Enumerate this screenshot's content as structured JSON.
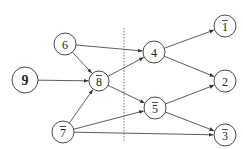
{
  "diagram": {
    "type": "directed-graph",
    "divider": {
      "x": 124,
      "y1": 28,
      "y2": 141,
      "style": "dashed"
    },
    "nodes": [
      {
        "id": "6",
        "label": "6",
        "overline": false,
        "bold": false,
        "x": 65,
        "y": 44,
        "r": 11
      },
      {
        "id": "9",
        "label": "9",
        "overline": false,
        "bold": true,
        "x": 25,
        "y": 80,
        "r": 13
      },
      {
        "id": "8",
        "label": "8",
        "overline": true,
        "bold": false,
        "x": 99,
        "y": 81,
        "r": 10
      },
      {
        "id": "7",
        "label": "7",
        "overline": true,
        "bold": false,
        "x": 63,
        "y": 132,
        "r": 11
      },
      {
        "id": "4",
        "label": "4",
        "overline": false,
        "bold": false,
        "x": 154,
        "y": 52,
        "r": 11
      },
      {
        "id": "5",
        "label": "5",
        "overline": true,
        "bold": false,
        "x": 155,
        "y": 108,
        "r": 11
      },
      {
        "id": "1",
        "label": "1",
        "overline": true,
        "bold": false,
        "x": 225,
        "y": 26,
        "r": 11
      },
      {
        "id": "2",
        "label": "2",
        "overline": false,
        "bold": false,
        "x": 225,
        "y": 81,
        "r": 11
      },
      {
        "id": "3",
        "label": "3",
        "overline": true,
        "bold": false,
        "x": 225,
        "y": 135,
        "r": 11
      }
    ],
    "edges": [
      {
        "from": "6",
        "to": "8"
      },
      {
        "from": "6",
        "to": "4"
      },
      {
        "from": "9",
        "to": "8"
      },
      {
        "from": "7",
        "to": "8"
      },
      {
        "from": "7",
        "to": "5"
      },
      {
        "from": "7",
        "to": "3"
      },
      {
        "from": "8",
        "to": "4"
      },
      {
        "from": "8",
        "to": "5"
      },
      {
        "from": "4",
        "to": "1"
      },
      {
        "from": "4",
        "to": "2"
      },
      {
        "from": "5",
        "to": "2"
      },
      {
        "from": "5",
        "to": "3"
      }
    ],
    "colors": {
      "stroke": "#333333",
      "background": "#ffffff",
      "text": "#222222"
    }
  }
}
